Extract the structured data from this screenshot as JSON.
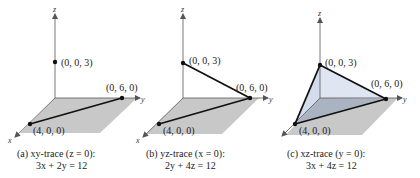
{
  "colors": {
    "plane_fill": "#c8c8c8",
    "tri_front": "#c9d4e6",
    "tri_side": "#dfe6f1",
    "tri_bottom": "#a9b3c2",
    "line": "#111111",
    "axis": "#555555"
  },
  "axes": {
    "x": "x",
    "y": "y",
    "z": "z"
  },
  "panels": [
    {
      "id": "a",
      "points": {
        "z_int": "(0, 0, 3)",
        "y_int": "(0, 6, 0)",
        "x_int": "(4, 0, 0)"
      },
      "caption_line1": "(a)  xy-trace (z = 0):",
      "caption_line2": "3x + 2y = 12"
    },
    {
      "id": "b",
      "points": {
        "z_int": "(0, 0, 3)",
        "y_int": "(0, 6, 0)",
        "x_int": "(4, 0, 0)"
      },
      "caption_line1": "(b)  yz-trace (x = 0):",
      "caption_line2": "2y + 4z = 12"
    },
    {
      "id": "c",
      "points": {
        "z_int": "(0, 0, 3)",
        "y_int": "(0, 6, 0)",
        "x_int": "(4, 0, 0)"
      },
      "caption_line1": "(c)  xz-trace (y = 0):",
      "caption_line2": "3x + 4z = 12"
    }
  ]
}
